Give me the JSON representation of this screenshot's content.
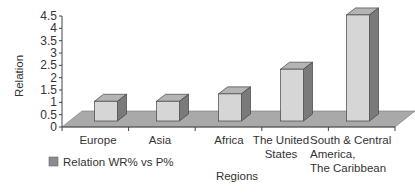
{
  "chart_data": {
    "type": "bar",
    "style": "3d-column",
    "title": "",
    "xlabel": "Regions",
    "ylabel": "Relation",
    "ylim": [
      0,
      4.5
    ],
    "yticks": [
      "0",
      "0.5",
      "1",
      "1.5",
      "2",
      "2.5",
      "3",
      "3.5",
      "4",
      "4.5"
    ],
    "categories": [
      "Europe",
      "Asia",
      "Africa",
      "The United States",
      "South & Central America, The Caribbean"
    ],
    "category_lines": [
      [
        "Europe"
      ],
      [
        "Asia"
      ],
      [
        "Africa"
      ],
      [
        "The United",
        "States"
      ],
      [
        "South & Central",
        "America,",
        "The Caribbean"
      ]
    ],
    "series": [
      {
        "name": "Relation WR% vs P%",
        "values": [
          0.8,
          0.8,
          1.1,
          2.1,
          4.3
        ]
      }
    ],
    "legend": {
      "position": "bottom-left",
      "entries": [
        "Relation WR% vs P%"
      ]
    },
    "grid": false,
    "colors": {
      "bar_front": "#d6d6d6",
      "bar_top": "#b4b4b4",
      "bar_side": "#7a7a7a",
      "floor": "#a9a9a9",
      "legend_swatch": "#8c8c8c"
    }
  }
}
